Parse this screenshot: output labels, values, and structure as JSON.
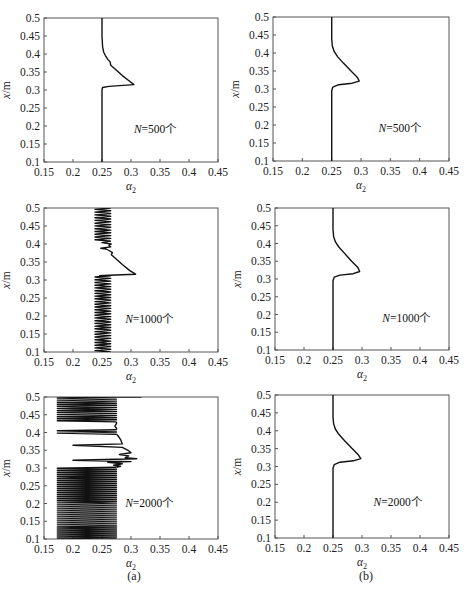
{
  "figure": {
    "caption_left": "(a)",
    "caption_right": "(b)"
  },
  "chart_data": [
    {
      "id": "a1",
      "column": "a",
      "type": "line",
      "title": "",
      "annotation": "N=500个",
      "annotation_italic": "N",
      "annotation_rest": "=500个",
      "xlabel": "α2",
      "ylabel": "x/m",
      "xlim": [
        0.15,
        0.45
      ],
      "ylim": [
        0.1,
        0.5
      ],
      "xticks": [
        0.15,
        0.2,
        0.25,
        0.3,
        0.35,
        0.4,
        0.45
      ],
      "yticks": [
        0.1,
        0.15,
        0.2,
        0.25,
        0.3,
        0.35,
        0.4,
        0.45,
        0.5
      ],
      "grid": false,
      "box": {
        "left": 44,
        "top": 18,
        "right": 218,
        "bottom": 162
      },
      "annot_pos": {
        "x": 0.305,
        "y": 0.18
      },
      "style": "smooth",
      "points": [
        [
          0.25,
          0.1
        ],
        [
          0.25,
          0.3
        ],
        [
          0.251,
          0.307
        ],
        [
          0.262,
          0.31
        ],
        [
          0.305,
          0.315
        ],
        [
          0.297,
          0.325
        ],
        [
          0.285,
          0.34
        ],
        [
          0.275,
          0.355
        ],
        [
          0.265,
          0.369
        ],
        [
          0.264,
          0.378
        ],
        [
          0.26,
          0.385
        ],
        [
          0.256,
          0.395
        ],
        [
          0.253,
          0.405
        ],
        [
          0.251,
          0.42
        ],
        [
          0.25,
          0.45
        ],
        [
          0.25,
          0.5
        ]
      ]
    },
    {
      "id": "b1",
      "column": "b",
      "type": "line",
      "title": "",
      "annotation": "N=500个",
      "annotation_italic": "N",
      "annotation_rest": "=500个",
      "xlabel": "α2",
      "ylabel": "x/m",
      "xlim": [
        0.15,
        0.45
      ],
      "ylim": [
        0.1,
        0.5
      ],
      "xticks": [
        0.15,
        0.2,
        0.25,
        0.3,
        0.35,
        0.4,
        0.45
      ],
      "yticks": [
        0.1,
        0.15,
        0.2,
        0.25,
        0.3,
        0.35,
        0.4,
        0.45,
        0.5
      ],
      "grid": false,
      "box": {
        "left": 273,
        "top": 17,
        "right": 449,
        "bottom": 161
      },
      "annot_pos": {
        "x": 0.33,
        "y": 0.18
      },
      "style": "smooth",
      "points": [
        [
          0.25,
          0.1
        ],
        [
          0.25,
          0.295
        ],
        [
          0.252,
          0.305
        ],
        [
          0.262,
          0.312
        ],
        [
          0.285,
          0.316
        ],
        [
          0.297,
          0.322
        ],
        [
          0.294,
          0.332
        ],
        [
          0.283,
          0.35
        ],
        [
          0.27,
          0.372
        ],
        [
          0.26,
          0.39
        ],
        [
          0.254,
          0.405
        ],
        [
          0.251,
          0.42
        ],
        [
          0.25,
          0.44
        ],
        [
          0.25,
          0.5
        ]
      ]
    },
    {
      "id": "a2",
      "column": "a",
      "type": "line",
      "title": "",
      "annotation": "N=1000个",
      "annotation_italic": "N",
      "annotation_rest": "=1000个",
      "xlabel": "α2",
      "ylabel": "x/m",
      "xlim": [
        0.15,
        0.45
      ],
      "ylim": [
        0.1,
        0.5
      ],
      "xticks": [
        0.15,
        0.2,
        0.25,
        0.3,
        0.35,
        0.4,
        0.45
      ],
      "yticks": [
        0.1,
        0.15,
        0.2,
        0.25,
        0.3,
        0.35,
        0.4,
        0.45,
        0.5
      ],
      "grid": false,
      "box": {
        "left": 44,
        "top": 208,
        "right": 218,
        "bottom": 352
      },
      "annot_pos": {
        "x": 0.29,
        "y": 0.18
      },
      "style": "oscillating",
      "oscillation": [
        {
          "y0": 0.1,
          "y1": 0.312,
          "xmin": 0.238,
          "xmax": 0.265,
          "cycles": 28
        },
        {
          "y0": 0.408,
          "y1": 0.5,
          "xmin": 0.238,
          "xmax": 0.265,
          "cycles": 12
        }
      ],
      "points": [
        [
          0.245,
          0.312
        ],
        [
          0.262,
          0.313
        ],
        [
          0.308,
          0.316
        ],
        [
          0.298,
          0.326
        ],
        [
          0.285,
          0.343
        ],
        [
          0.272,
          0.362
        ],
        [
          0.266,
          0.37
        ],
        [
          0.268,
          0.376
        ],
        [
          0.262,
          0.382
        ],
        [
          0.257,
          0.386
        ],
        [
          0.248,
          0.388
        ],
        [
          0.265,
          0.392
        ],
        [
          0.262,
          0.396
        ],
        [
          0.266,
          0.4
        ],
        [
          0.25,
          0.404
        ],
        [
          0.265,
          0.408
        ]
      ]
    },
    {
      "id": "b2",
      "column": "b",
      "type": "line",
      "title": "",
      "annotation": "N=1000个",
      "annotation_italic": "N",
      "annotation_rest": "=1000个",
      "xlabel": "α2",
      "ylabel": "x/m",
      "xlim": [
        0.15,
        0.45
      ],
      "ylim": [
        0.1,
        0.5
      ],
      "xticks": [
        0.15,
        0.2,
        0.25,
        0.3,
        0.35,
        0.4,
        0.45
      ],
      "yticks": [
        0.1,
        0.15,
        0.2,
        0.25,
        0.3,
        0.35,
        0.4,
        0.45,
        0.5
      ],
      "grid": false,
      "box": {
        "left": 275,
        "top": 208,
        "right": 449,
        "bottom": 350
      },
      "annot_pos": {
        "x": 0.335,
        "y": 0.18
      },
      "style": "smooth",
      "points": [
        [
          0.25,
          0.1
        ],
        [
          0.25,
          0.295
        ],
        [
          0.252,
          0.305
        ],
        [
          0.262,
          0.311
        ],
        [
          0.285,
          0.315
        ],
        [
          0.296,
          0.321
        ],
        [
          0.293,
          0.332
        ],
        [
          0.282,
          0.35
        ],
        [
          0.27,
          0.372
        ],
        [
          0.26,
          0.39
        ],
        [
          0.254,
          0.405
        ],
        [
          0.251,
          0.42
        ],
        [
          0.25,
          0.44
        ],
        [
          0.25,
          0.5
        ]
      ]
    },
    {
      "id": "a3",
      "column": "a",
      "type": "line",
      "title": "",
      "annotation": "N=2000个",
      "annotation_italic": "N",
      "annotation_rest": "=2000个",
      "xlabel": "α2",
      "ylabel": "x/m",
      "xlim": [
        0.15,
        0.45
      ],
      "ylim": [
        0.1,
        0.5
      ],
      "xticks": [
        0.15,
        0.2,
        0.25,
        0.3,
        0.35,
        0.4,
        0.45
      ],
      "yticks": [
        0.1,
        0.15,
        0.2,
        0.25,
        0.3,
        0.35,
        0.4,
        0.45,
        0.5
      ],
      "grid": false,
      "box": {
        "left": 44,
        "top": 397,
        "right": 218,
        "bottom": 539
      },
      "annot_pos": {
        "x": 0.29,
        "y": 0.19
      },
      "style": "oscillating",
      "oscillation": [
        {
          "y0": 0.1,
          "y1": 0.302,
          "xmin": 0.173,
          "xmax": 0.275,
          "cycles": 36
        },
        {
          "y0": 0.43,
          "y1": 0.5,
          "xmin": 0.173,
          "xmax": 0.275,
          "cycles": 12
        },
        {
          "y0": 0.395,
          "y1": 0.408,
          "xmin": 0.173,
          "xmax": 0.275,
          "cycles": 2
        }
      ],
      "points": [
        [
          0.275,
          0.302
        ],
        [
          0.282,
          0.305
        ],
        [
          0.27,
          0.308
        ],
        [
          0.285,
          0.312
        ],
        [
          0.26,
          0.316
        ],
        [
          0.3,
          0.318
        ],
        [
          0.2,
          0.322
        ],
        [
          0.31,
          0.326
        ],
        [
          0.29,
          0.329
        ],
        [
          0.296,
          0.334
        ],
        [
          0.28,
          0.338
        ],
        [
          0.3,
          0.343
        ],
        [
          0.295,
          0.35
        ],
        [
          0.285,
          0.358
        ],
        [
          0.2,
          0.364
        ],
        [
          0.285,
          0.368
        ],
        [
          0.282,
          0.38
        ],
        [
          0.278,
          0.39
        ],
        [
          0.275,
          0.395
        ]
      ],
      "extra_points": [
        [
          0.275,
          0.408
        ],
        [
          0.275,
          0.412
        ],
        [
          0.272,
          0.418
        ],
        [
          0.275,
          0.425
        ],
        [
          0.275,
          0.43
        ]
      ],
      "stray_top": [
        [
          0.275,
          0.5
        ],
        [
          0.318,
          0.5
        ]
      ]
    },
    {
      "id": "b3",
      "column": "b",
      "type": "line",
      "title": "",
      "annotation": "N=2000个",
      "annotation_italic": "N",
      "annotation_rest": "=2000个",
      "xlabel": "α2",
      "ylabel": "x/m",
      "xlim": [
        0.15,
        0.45
      ],
      "ylim": [
        0.1,
        0.5
      ],
      "xticks": [
        0.15,
        0.2,
        0.25,
        0.3,
        0.35,
        0.4,
        0.45
      ],
      "yticks": [
        0.1,
        0.15,
        0.2,
        0.25,
        0.3,
        0.35,
        0.4,
        0.45,
        0.5
      ],
      "grid": false,
      "box": {
        "left": 275,
        "top": 395,
        "right": 449,
        "bottom": 538
      },
      "annot_pos": {
        "x": 0.32,
        "y": 0.19
      },
      "style": "smooth",
      "points": [
        [
          0.25,
          0.1
        ],
        [
          0.25,
          0.295
        ],
        [
          0.252,
          0.305
        ],
        [
          0.262,
          0.312
        ],
        [
          0.285,
          0.316
        ],
        [
          0.298,
          0.322
        ],
        [
          0.294,
          0.332
        ],
        [
          0.283,
          0.35
        ],
        [
          0.27,
          0.372
        ],
        [
          0.26,
          0.39
        ],
        [
          0.254,
          0.405
        ],
        [
          0.251,
          0.42
        ],
        [
          0.25,
          0.44
        ],
        [
          0.25,
          0.5
        ]
      ]
    }
  ]
}
